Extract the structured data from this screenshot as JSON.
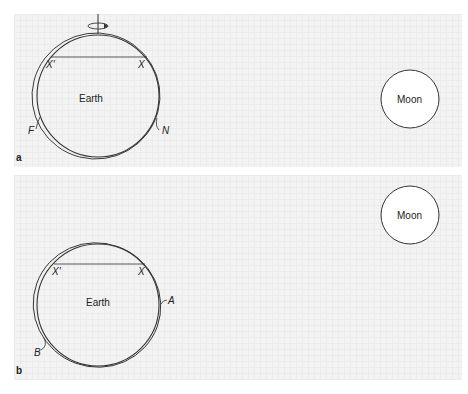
{
  "panels": [
    {
      "id": "a",
      "letter": "a",
      "earth_label": "Earth",
      "moon_label": "Moon",
      "chord_left_label": "X'",
      "chord_right_label": "X",
      "bulge_near_label": "N",
      "bulge_far_label": "F",
      "rotation_axis": true
    },
    {
      "id": "b",
      "letter": "b",
      "earth_label": "Earth",
      "moon_label": "Moon",
      "chord_left_label": "X'",
      "chord_right_label": "X",
      "bulge_near_label": "A",
      "bulge_far_label": "B",
      "rotation_axis": false
    }
  ],
  "colors": {
    "line": "#333333",
    "panel_bg": "#f3f3f3",
    "moon_fill": "#ffffff"
  }
}
